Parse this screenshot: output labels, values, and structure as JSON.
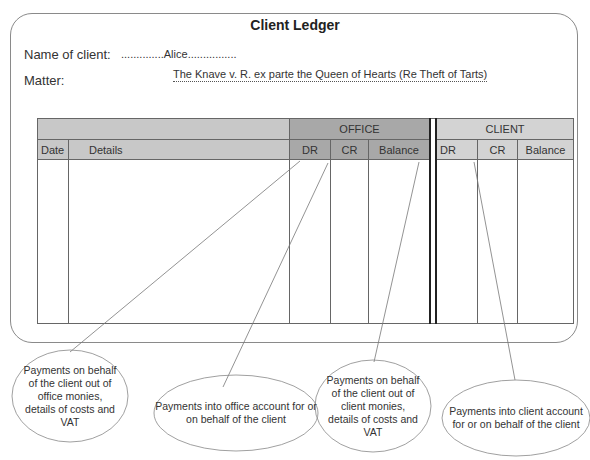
{
  "title": "Client Ledger",
  "client": {
    "label": "Name of client:",
    "value": "..............Alice................"
  },
  "matter": {
    "label": "Matter:",
    "value": "The Knave v. R. ex parte the Queen of Hearts (Re Theft of Tarts)"
  },
  "table": {
    "groups": {
      "office": "OFFICE",
      "client": "CLIENT"
    },
    "columns": {
      "date": "Date",
      "details": "Details",
      "office_dr": "DR",
      "office_cr": "CR",
      "office_balance": "Balance",
      "client_dr": "DR",
      "client_cr": "CR",
      "client_balance": "Balance"
    }
  },
  "callouts": [
    {
      "id": "office-dr",
      "text": "Payments on behalf of the client out of office monies, details of costs and VAT"
    },
    {
      "id": "office-cr",
      "text": "Payments into office account for or on behalf of the client"
    },
    {
      "id": "client-dr",
      "text": "Payments on behalf of the client out of client monies, details of costs and VAT"
    },
    {
      "id": "client-cr",
      "text": "Payments into client account for or on behalf of the client"
    }
  ],
  "colors": {
    "header_grey": "#c8c8c8",
    "office_grey": "#a8a8a8",
    "client_grey": "#d3d3d3",
    "line": "#666666"
  }
}
